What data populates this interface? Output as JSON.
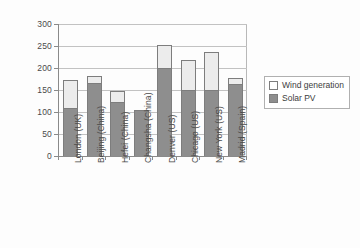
{
  "chart_data": {
    "type": "bar",
    "stacked": true,
    "title": "",
    "xlabel": "",
    "ylabel": "kWh/m2",
    "ylim": [
      0,
      300
    ],
    "ytick_step": 50,
    "yticks": [
      "300",
      "250",
      "200",
      "150",
      "100",
      "50",
      "0"
    ],
    "grid": true,
    "legend_position": "right",
    "categories": [
      "London (UK)",
      "Beijing (China)",
      "Hefei (China)",
      "Changsha (China)",
      "Denver (US)",
      "Chicago (US)",
      "New York (US)",
      "Madrid (Spain)"
    ],
    "series": [
      {
        "name": "Solar PV",
        "color": "#8e8e8e",
        "values": [
          110,
          165,
          122,
          105,
          200,
          150,
          150,
          164
        ]
      },
      {
        "name": "Wind generation",
        "color": "#ececec",
        "values": [
          62,
          18,
          26,
          0,
          53,
          69,
          87,
          14
        ]
      }
    ],
    "totals": [
      172,
      183,
      148,
      105,
      253,
      219,
      237,
      178
    ]
  },
  "legend": {
    "items": [
      {
        "label": "Wind generation",
        "swatch": "wind"
      },
      {
        "label": "Solar PV",
        "swatch": "solar"
      }
    ]
  },
  "axis": {
    "y_title": "kWh/m2"
  }
}
